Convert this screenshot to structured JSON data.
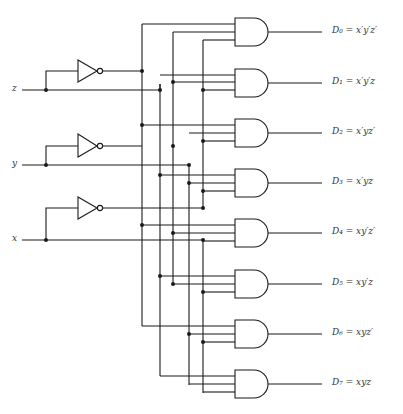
{
  "inputs": [
    {
      "name": "z",
      "label": "z",
      "y": 90
    },
    {
      "name": "y",
      "label": "y",
      "y": 165
    },
    {
      "name": "x",
      "label": "x",
      "y": 240
    }
  ],
  "inverters": [
    {
      "input": "z",
      "output": "z'",
      "y": 71
    },
    {
      "input": "y",
      "output": "y'",
      "y": 145
    },
    {
      "input": "x",
      "output": "x'",
      "y": 208
    }
  ],
  "outputs": [
    {
      "id": "D0",
      "label": "D₀ = x′y′z′",
      "expr": "x'y'z'"
    },
    {
      "id": "D1",
      "label": "D₁ = x′y′z",
      "expr": "x'y'z"
    },
    {
      "id": "D2",
      "label": "D₂ = x′yz′",
      "expr": "x'yz'"
    },
    {
      "id": "D3",
      "label": "D₃ = x′yz",
      "expr": "x'yz"
    },
    {
      "id": "D4",
      "label": "D₄ = xy′z′",
      "expr": "xy'z'"
    },
    {
      "id": "D5",
      "label": "D₅ = xy′z",
      "expr": "xy'z"
    },
    {
      "id": "D6",
      "label": "D₆ = xyz′",
      "expr": "xyz'"
    },
    {
      "id": "D7",
      "label": "D₇ = xyz",
      "expr": "xyz"
    }
  ],
  "gate_type": "AND",
  "colors": {
    "line": "#1a1a1a",
    "label": "#333333",
    "background": "#ffffff"
  }
}
